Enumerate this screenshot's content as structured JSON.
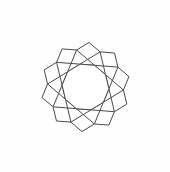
{
  "figure": {
    "name": "pentagon-rosette",
    "background_color": "#fefefe",
    "stroke_color": "#4a4a4a",
    "fill_color": "#ffffff",
    "stroke_width": 1,
    "canvas": {
      "width": 170,
      "height": 172
    },
    "center": {
      "x": 85.5,
      "y": 87
    },
    "symmetry_order": 10,
    "tile_count": 10,
    "tile_shape": "pentagon",
    "hole_shape": "decagon",
    "hole_circumradius": 23.5,
    "hole_vertex_start_angle_deg": -103.5,
    "outer_apex_radius": 77,
    "pentagon_side": 14.5,
    "extents": {
      "top_apex": {
        "x": 85.5,
        "y": 10
      },
      "bottom_apex": {
        "x": 85.5,
        "y": 165
      },
      "left_vertex": {
        "x": 13,
        "y": 87
      },
      "right_vertex": {
        "x": 158,
        "y": 87
      }
    }
  },
  "chart_data": {
    "type": "diagram",
    "elements": [
      {
        "name": "inner-decagon-hole",
        "sides": 10,
        "count": 1
      },
      {
        "name": "pentagon-tile",
        "sides": 5,
        "count": 10
      }
    ]
  }
}
